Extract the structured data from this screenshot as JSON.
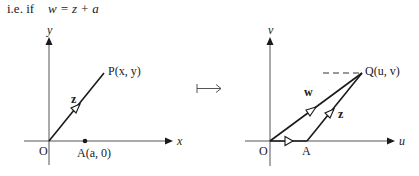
{
  "caption": {
    "prefix": "i.e. if",
    "equation": "w = z + a"
  },
  "left_plane": {
    "y_axis_label": "y",
    "x_axis_label": "x",
    "origin_label": "O",
    "point_p_label": "P(x, y)",
    "point_a_label": "A(a, 0)",
    "vector_label": "z"
  },
  "mapping_symbol": "↦",
  "right_plane": {
    "v_axis_label": "v",
    "u_axis_label": "u",
    "origin_label": "O",
    "point_a_label": "A",
    "point_q_label": "Q(u, v)",
    "vector_w_label": "w",
    "vector_z_label": "z"
  },
  "colors": {
    "ink": "#1a1a1a",
    "axis": "#555555",
    "background": "#ffffff"
  }
}
